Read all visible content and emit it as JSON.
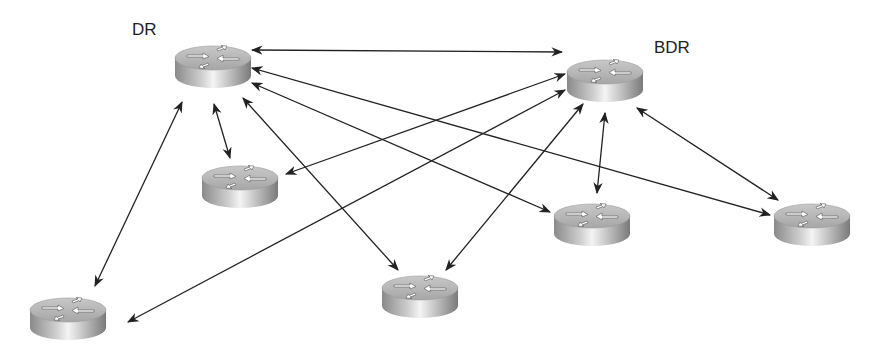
{
  "diagram": {
    "title": "",
    "labels": {
      "dr": "DR",
      "bdr": "BDR"
    },
    "colors": {
      "background": "#ffffff",
      "line": "#333333",
      "router_top": "#b8b8b8",
      "router_side_light": "#f0f0f0",
      "router_side_dark": "#7a7a7a",
      "label": "#222222"
    },
    "nodes": [
      {
        "id": "dr",
        "role": "DR",
        "label": "DR",
        "x": 213,
        "y": 70
      },
      {
        "id": "bdr",
        "role": "BDR",
        "label": "BDR",
        "x": 605,
        "y": 85
      },
      {
        "id": "r1",
        "role": "DROther",
        "label": "",
        "x": 240,
        "y": 185
      },
      {
        "id": "r2",
        "role": "DROther",
        "label": "",
        "x": 68,
        "y": 318
      },
      {
        "id": "r3",
        "role": "DROther",
        "label": "",
        "x": 420,
        "y": 295
      },
      {
        "id": "r4",
        "role": "DROther",
        "label": "",
        "x": 592,
        "y": 225
      },
      {
        "id": "r5",
        "role": "DROther",
        "label": "",
        "x": 812,
        "y": 225
      }
    ],
    "edges": [
      {
        "from": "dr",
        "to": "bdr",
        "type": "bidirectional"
      },
      {
        "from": "dr",
        "to": "r1",
        "type": "bidirectional"
      },
      {
        "from": "dr",
        "to": "r2",
        "type": "bidirectional"
      },
      {
        "from": "dr",
        "to": "r3",
        "type": "bidirectional"
      },
      {
        "from": "dr",
        "to": "r4",
        "type": "bidirectional"
      },
      {
        "from": "dr",
        "to": "r5",
        "type": "bidirectional"
      },
      {
        "from": "bdr",
        "to": "r1",
        "type": "bidirectional"
      },
      {
        "from": "bdr",
        "to": "r2",
        "type": "bidirectional"
      },
      {
        "from": "bdr",
        "to": "r3",
        "type": "bidirectional"
      },
      {
        "from": "bdr",
        "to": "r4",
        "type": "bidirectional"
      },
      {
        "from": "bdr",
        "to": "r5",
        "type": "bidirectional"
      }
    ]
  }
}
